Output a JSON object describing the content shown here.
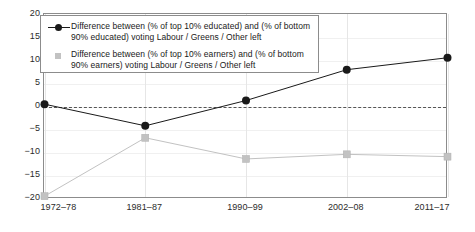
{
  "chart_data": {
    "type": "line",
    "title": "",
    "xlabel": "",
    "ylabel": "",
    "categories": [
      "1972–78",
      "1981–87",
      "1990–99",
      "2002–08",
      "2011–17"
    ],
    "ylim": [
      -20,
      20
    ],
    "yticks": [
      20,
      15,
      10,
      5,
      0,
      -5,
      -10,
      -15,
      -20
    ],
    "ytick_labels": [
      "20",
      "15",
      "10",
      "5",
      "0",
      "−5",
      "−10",
      "−15",
      "−20"
    ],
    "grid": true,
    "zero_line": true,
    "legend_position": "top-left",
    "series": [
      {
        "name": "Difference between (% of top 10% educated) and (% of bottom 90% educated) voting Labour / Greens / Other left",
        "legend_line1": "Difference between (% of top 10% educated) and (% of bottom 90%",
        "legend_line2": "educated) voting Labour / Greens / Other left",
        "marker": "circle",
        "color": "#1a1a1a",
        "values": [
          0.5,
          -4.2,
          1.3,
          8.0,
          10.6
        ]
      },
      {
        "name": "Difference between (% of top 10% earners) and (% of bottom 90% earners) voting Labour / Greens / Other left",
        "legend_line1": "Difference between (% of top 10% earners) and (% of bottom 90%",
        "legend_line2": "earners) voting Labour / Greens / Other left",
        "marker": "square",
        "color": "#c2c2c2",
        "values": [
          -19.5,
          -6.8,
          -11.4,
          -10.4,
          -10.9
        ]
      }
    ]
  },
  "colors": {
    "series_educated": "#1a1a1a",
    "series_earners": "#c2c2c2",
    "frame": "#8c8c8c",
    "grid": "#e6e6e6",
    "zero_line": "#555555",
    "background": "#ffffff",
    "text": "#2b2b2b"
  }
}
